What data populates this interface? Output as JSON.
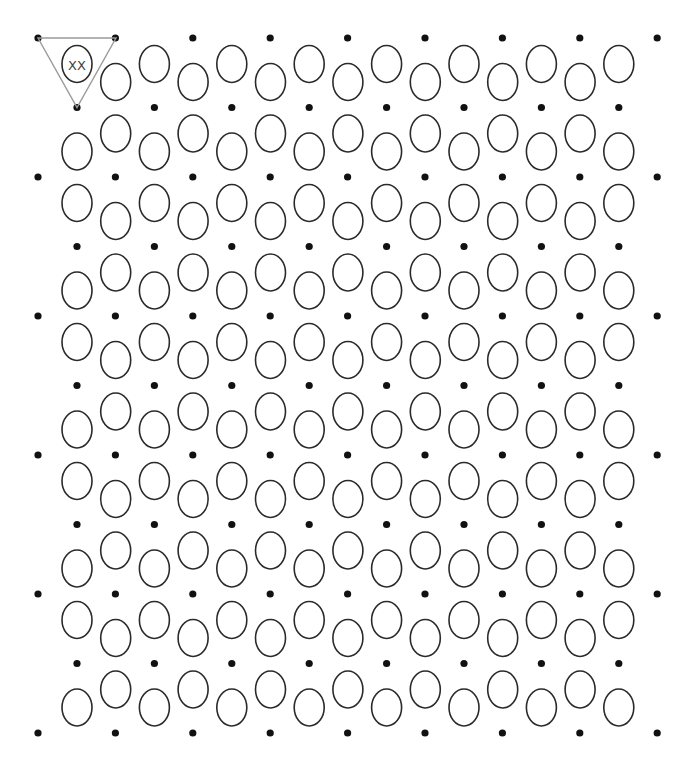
{
  "grid": {
    "dot_rows": 11,
    "row_y_start": 38,
    "row_y_step": 69.5,
    "full_row": {
      "count": 9,
      "x_start": 38,
      "x_step": 77.4
    },
    "inner_row": {
      "count": 8,
      "x_start": 77,
      "x_step": 77.4
    },
    "first_row_type": "full",
    "dot_radius": 3.6,
    "ellipse": {
      "rx": 15,
      "ry": 18.5,
      "down_offset": 26,
      "up_offset": 44
    },
    "colors": {
      "dot": "#111111",
      "ellipse_stroke": "#2a2a2a",
      "highlight": "#9a9a9a",
      "label": "#444444",
      "background": "#ffffff"
    }
  },
  "highlight": {
    "band": 0,
    "cell": 0,
    "label": "XX",
    "triangle": [
      [
        38,
        38
      ],
      [
        116,
        38
      ],
      [
        77,
        107.5
      ]
    ]
  },
  "summary": {
    "bands": 10,
    "cells_per_band": 15,
    "total_cells": 150,
    "total_dots": 93
  }
}
